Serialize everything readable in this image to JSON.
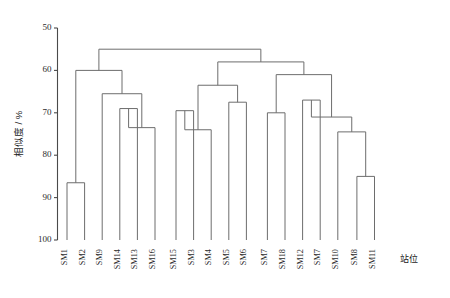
{
  "chart_data": {
    "type": "dendrogram",
    "title": "",
    "xlabel": "站位",
    "ylabel": "相似度 / %",
    "ylim": [
      50,
      100
    ],
    "y_inverted": true,
    "grid": false,
    "yticks": [
      50,
      60,
      70,
      80,
      90,
      100
    ],
    "ytick_labels": [
      "50",
      "60",
      "70",
      "80",
      "90",
      "100"
    ],
    "leaves": [
      "SM1",
      "SM2",
      "SM9",
      "SM14",
      "SM13",
      "SM16",
      "SM15",
      "SM3",
      "SM4",
      "SM5",
      "SM6",
      "SM7",
      "SM18",
      "SM12",
      "SM7",
      "SM10",
      "SM8",
      "SM11"
    ],
    "merges": [
      {
        "id": "m1",
        "left": "SM1",
        "right": "SM2",
        "similarity": 86.5
      },
      {
        "id": "m2",
        "left": "SM14",
        "right": "SM13",
        "similarity": 69.0
      },
      {
        "id": "m3",
        "left": "m2",
        "right": "SM16",
        "similarity": 73.5
      },
      {
        "id": "m4",
        "left": "SM9",
        "right": "m3",
        "similarity": 65.5
      },
      {
        "id": "m5",
        "left": "m1",
        "right": "m4",
        "similarity": 60.0
      },
      {
        "id": "m6",
        "left": "SM15",
        "right": "SM3",
        "similarity": 69.5
      },
      {
        "id": "m7",
        "left": "m6",
        "right": "SM4",
        "similarity": 74.0
      },
      {
        "id": "m8",
        "left": "SM5",
        "right": "SM6",
        "similarity": 67.5
      },
      {
        "id": "m9",
        "left": "m7",
        "right": "m8",
        "similarity": 63.5
      },
      {
        "id": "m10",
        "left": "SM7",
        "right": "SM18",
        "similarity": 70.0
      },
      {
        "id": "m11",
        "left": "SM12",
        "right": "SM7",
        "similarity": 67.0
      },
      {
        "id": "m12",
        "left": "SM8",
        "right": "SM11",
        "similarity": 85.0
      },
      {
        "id": "m13",
        "left": "SM10",
        "right": "m12",
        "similarity": 74.5
      },
      {
        "id": "m14",
        "left": "m11",
        "right": "m13",
        "similarity": 71.0
      },
      {
        "id": "m15",
        "left": "m10",
        "right": "m14",
        "similarity": 61.0
      },
      {
        "id": "m16",
        "left": "m9",
        "right": "m15",
        "similarity": 58.0
      },
      {
        "id": "m17",
        "left": "m5",
        "right": "m16",
        "similarity": 55.0
      }
    ],
    "axis_color": "#4a4a4a",
    "link_color": "#6d6d6d",
    "background": "#ffffff"
  }
}
